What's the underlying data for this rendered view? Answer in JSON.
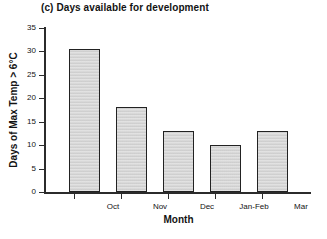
{
  "chart_data": {
    "type": "bar",
    "title": "(c) Days available for development",
    "xlabel": "Month",
    "ylabel": "Days of Max Temp > 6°C",
    "categories": [
      "Oct",
      "Nov",
      "Dec",
      "Jan-Feb",
      "Mar"
    ],
    "values": [
      30.5,
      18.2,
      13.0,
      10.0,
      13.0
    ],
    "ylim": [
      0,
      35
    ],
    "ytick_labels": [
      "0",
      "5",
      "10",
      "15",
      "20",
      "25",
      "30",
      "35"
    ],
    "ytick_values": [
      0,
      5,
      10,
      15,
      20,
      25,
      30,
      35
    ],
    "grid": false,
    "legend": "none",
    "bar_fill_color": "#d5d5d5",
    "bar_edge_color": "#222222",
    "axis_color": "#2b2b2b",
    "background_color": "#ffffff"
  }
}
